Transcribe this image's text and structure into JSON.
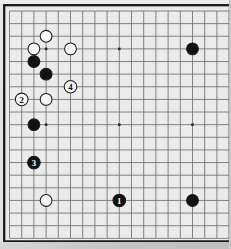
{
  "board": {
    "game": "go",
    "size": 19,
    "colors": {
      "paper": "#e4e4e4",
      "board_bg": "#ebebeb",
      "grid_line": "#6f6f6f",
      "frame": "#1b1b1b",
      "star_point": "#252525",
      "black_stone": "#121212",
      "white_stone": "#f6f6f6",
      "stone_outline": "#1c1c1c",
      "label_on_black": "#ffffff",
      "label_on_white": "#0a0a0a"
    },
    "star_points": [
      {
        "col": 4,
        "row": 4
      },
      {
        "col": 10,
        "row": 4
      },
      {
        "col": 16,
        "row": 4
      },
      {
        "col": 4,
        "row": 10
      },
      {
        "col": 10,
        "row": 10
      },
      {
        "col": 16,
        "row": 10
      },
      {
        "col": 4,
        "row": 16
      },
      {
        "col": 10,
        "row": 16
      },
      {
        "col": 16,
        "row": 16
      }
    ],
    "stones": [
      {
        "col": 4,
        "row": 3,
        "color": "white",
        "label": ""
      },
      {
        "col": 3,
        "row": 4,
        "color": "white",
        "label": ""
      },
      {
        "col": 6,
        "row": 4,
        "color": "white",
        "label": ""
      },
      {
        "col": 16,
        "row": 4,
        "color": "black",
        "label": ""
      },
      {
        "col": 3,
        "row": 5,
        "color": "black",
        "label": ""
      },
      {
        "col": 4,
        "row": 6,
        "color": "black",
        "label": ""
      },
      {
        "col": 6,
        "row": 7,
        "color": "white",
        "label": "4"
      },
      {
        "col": 2,
        "row": 8,
        "color": "white",
        "label": "2"
      },
      {
        "col": 4,
        "row": 8,
        "color": "white",
        "label": ""
      },
      {
        "col": 3,
        "row": 10,
        "color": "black",
        "label": ""
      },
      {
        "col": 3,
        "row": 13,
        "color": "black",
        "label": "3"
      },
      {
        "col": 4,
        "row": 16,
        "color": "white",
        "label": ""
      },
      {
        "col": 10,
        "row": 16,
        "color": "black",
        "label": "1"
      },
      {
        "col": 16,
        "row": 16,
        "color": "black",
        "label": ""
      }
    ]
  }
}
